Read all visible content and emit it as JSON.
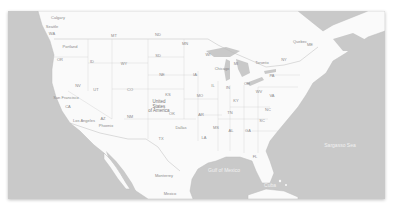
{
  "map": {
    "colors": {
      "water": "#c9c9c9",
      "land": "#fafafa",
      "border": "#bdbdbd",
      "label": "#8a8a8a"
    },
    "country_label": "United\nStates\nof America",
    "regions": [
      {
        "id": "WA",
        "label": "WA",
        "x": 52,
        "y": 34
      },
      {
        "id": "OR",
        "label": "OR",
        "x": 60,
        "y": 60
      },
      {
        "id": "CA",
        "label": "CA",
        "x": 68,
        "y": 107
      },
      {
        "id": "NV",
        "label": "NV",
        "x": 78,
        "y": 86
      },
      {
        "id": "ID",
        "label": "ID",
        "x": 92,
        "y": 62
      },
      {
        "id": "MT",
        "label": "MT",
        "x": 114,
        "y": 36
      },
      {
        "id": "WY",
        "label": "WY",
        "x": 124,
        "y": 64
      },
      {
        "id": "UT",
        "label": "UT",
        "x": 96,
        "y": 90
      },
      {
        "id": "CO",
        "label": "CO",
        "x": 130,
        "y": 90
      },
      {
        "id": "AZ",
        "label": "AZ",
        "x": 103,
        "y": 119
      },
      {
        "id": "NM",
        "label": "NM",
        "x": 130,
        "y": 117
      },
      {
        "id": "ND",
        "label": "ND",
        "x": 158,
        "y": 35
      },
      {
        "id": "SD",
        "label": "SD",
        "x": 158,
        "y": 56
      },
      {
        "id": "NE",
        "label": "NE",
        "x": 162,
        "y": 75
      },
      {
        "id": "KS",
        "label": "KS",
        "x": 168,
        "y": 95
      },
      {
        "id": "OK",
        "label": "OK",
        "x": 172,
        "y": 114
      },
      {
        "id": "TX",
        "label": "TX",
        "x": 161,
        "y": 139
      },
      {
        "id": "MN",
        "label": "MN",
        "x": 185,
        "y": 44
      },
      {
        "id": "IA",
        "label": "IA",
        "x": 195,
        "y": 75
      },
      {
        "id": "MO",
        "label": "MO",
        "x": 200,
        "y": 96
      },
      {
        "id": "AR",
        "label": "AR",
        "x": 201,
        "y": 115
      },
      {
        "id": "LA",
        "label": "LA",
        "x": 204,
        "y": 138
      },
      {
        "id": "WI",
        "label": "WI",
        "x": 208,
        "y": 55
      },
      {
        "id": "IL",
        "label": "IL",
        "x": 213,
        "y": 86
      },
      {
        "id": "MI",
        "label": "MI",
        "x": 236,
        "y": 64
      },
      {
        "id": "IN",
        "label": "IN",
        "x": 228,
        "y": 88
      },
      {
        "id": "OH",
        "label": "OH",
        "x": 247,
        "y": 84
      },
      {
        "id": "KY",
        "label": "KY",
        "x": 236,
        "y": 101
      },
      {
        "id": "TN",
        "label": "TN",
        "x": 230,
        "y": 113
      },
      {
        "id": "MS",
        "label": "MS",
        "x": 216,
        "y": 128
      },
      {
        "id": "AL",
        "label": "AL",
        "x": 231,
        "y": 131
      },
      {
        "id": "GA",
        "label": "GA",
        "x": 248,
        "y": 131
      },
      {
        "id": "FL",
        "label": "FL",
        "x": 255,
        "y": 157
      },
      {
        "id": "SC",
        "label": "SC",
        "x": 262,
        "y": 121
      },
      {
        "id": "NC",
        "label": "NC",
        "x": 268,
        "y": 110
      },
      {
        "id": "VA",
        "label": "VA",
        "x": 272,
        "y": 96
      },
      {
        "id": "WV",
        "label": "WV",
        "x": 259,
        "y": 92
      },
      {
        "id": "PA",
        "label": "PA",
        "x": 272,
        "y": 76
      },
      {
        "id": "NY",
        "label": "NY",
        "x": 284,
        "y": 60
      },
      {
        "id": "ME",
        "label": "ME",
        "x": 310,
        "y": 45
      }
    ],
    "places": [
      {
        "label": "Calgary",
        "x": 58,
        "y": 18
      },
      {
        "label": "Seattle",
        "x": 52,
        "y": 27
      },
      {
        "label": "Portland",
        "x": 70,
        "y": 47
      },
      {
        "label": "San Francisco",
        "x": 66,
        "y": 98
      },
      {
        "label": "Los Angeles",
        "x": 84,
        "y": 121
      },
      {
        "label": "Phoenix",
        "x": 106,
        "y": 126
      },
      {
        "label": "Dallas",
        "x": 181,
        "y": 128
      },
      {
        "label": "Chicago",
        "x": 222,
        "y": 69
      },
      {
        "label": "Monterrey",
        "x": 164,
        "y": 176
      },
      {
        "label": "Mexico",
        "x": 170,
        "y": 194
      },
      {
        "label": "Toronto",
        "x": 262,
        "y": 63
      },
      {
        "label": "Quebec",
        "x": 300,
        "y": 42
      }
    ],
    "water_labels": [
      {
        "label": "Gulf of Mexico",
        "x": 224,
        "y": 170
      },
      {
        "label": "Sargasso Sea",
        "x": 340,
        "y": 145
      },
      {
        "label": "Cuba",
        "x": 270,
        "y": 185
      }
    ],
    "country_label_pos": {
      "x": 151,
      "y": 96
    }
  }
}
